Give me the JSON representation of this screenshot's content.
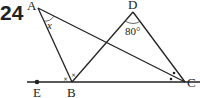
{
  "problem_number": "24",
  "points": {
    "A": {
      "label": "A"
    },
    "B": {
      "label": "B"
    },
    "C": {
      "label": "C"
    },
    "D": {
      "label": "D"
    },
    "E": {
      "label": "E"
    }
  },
  "angles": {
    "x_label": "x",
    "d_label": "80°"
  },
  "marks": {
    "cross": "×",
    "dot": "•"
  }
}
